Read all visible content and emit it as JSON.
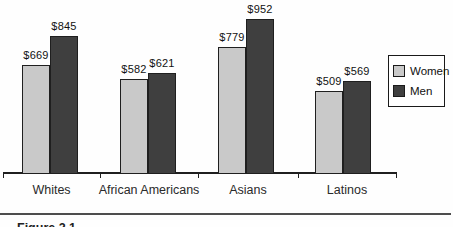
{
  "figure": {
    "caption": "Figure 2.1"
  },
  "chart_data": {
    "type": "bar",
    "title": "",
    "categories": [
      "Whites",
      "African Americans",
      "Asians",
      "Latinos"
    ],
    "series": [
      {
        "name": "Women",
        "color": "#c9c9c9",
        "values": [
          669,
          582,
          779,
          509
        ]
      },
      {
        "name": "Men",
        "color": "#3f3f3f",
        "values": [
          845,
          621,
          952,
          569
        ]
      }
    ],
    "value_prefix": "$",
    "data_labels": [
      "$669",
      "$845",
      "$582",
      "$621",
      "$779",
      "$952",
      "$509",
      "$569"
    ],
    "ylim": [
      0,
      1000
    ],
    "grid": false,
    "axis_color": "#1f1f1f",
    "bar_border_color": "#1f1f1f",
    "legend_position": "right",
    "legend_entries": [
      "Women",
      "Men"
    ]
  }
}
